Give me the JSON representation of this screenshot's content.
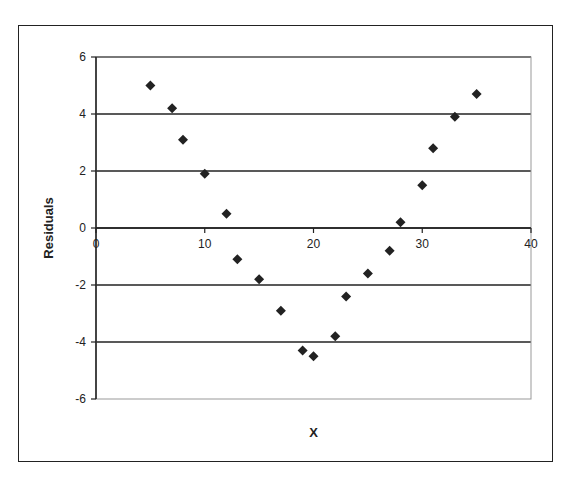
{
  "chart_data": {
    "type": "scatter",
    "title": "",
    "xlabel": "X",
    "ylabel": "Residuals",
    "xlim": [
      0,
      40
    ],
    "ylim": [
      -6,
      6
    ],
    "x_ticks": [
      0,
      10,
      20,
      30,
      40
    ],
    "y_ticks": [
      -6,
      -4,
      -2,
      0,
      2,
      4,
      6
    ],
    "grid": {
      "horizontal": true,
      "vertical": false
    },
    "legend": null,
    "marker": "diamond",
    "marker_color": "#222222",
    "series": [
      {
        "name": "Residuals",
        "x": [
          5,
          7,
          8,
          10,
          12,
          13,
          15,
          17,
          19,
          20,
          22,
          23,
          25,
          27,
          28,
          30,
          31,
          33,
          35
        ],
        "y": [
          5.0,
          4.2,
          3.1,
          1.9,
          0.5,
          -1.1,
          -1.8,
          -2.9,
          -4.3,
          -4.5,
          -3.8,
          -2.4,
          -1.6,
          -0.8,
          0.2,
          1.5,
          2.8,
          3.9,
          4.7
        ]
      }
    ]
  }
}
